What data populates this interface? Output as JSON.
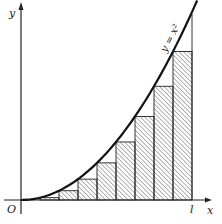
{
  "figure": {
    "curve_label": "y = x²",
    "x_axis_label": "x",
    "y_axis_label": "y",
    "origin_label": "O",
    "endpoint_label": "l",
    "intervals": 9,
    "colors": {
      "stroke": "#222222",
      "hatch": "#555555",
      "background": "#ffffff"
    }
  },
  "geometry": {
    "origin_px": [
      21,
      200
    ],
    "l_px": 192,
    "curve_top_px": 12,
    "x_axis_end_px": 205,
    "y_axis_top_px": 2
  }
}
